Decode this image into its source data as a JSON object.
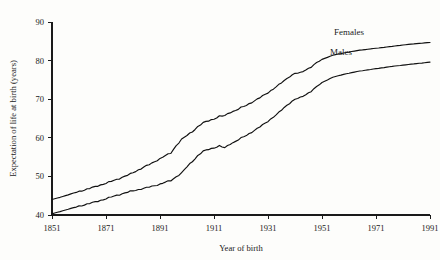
{
  "chart_data": {
    "type": "line",
    "title": "",
    "xlabel": "Year of birth",
    "ylabel": "Expectation of life at birth (years)",
    "xlim": [
      1851,
      1991
    ],
    "ylim": [
      40,
      90
    ],
    "xticks": [
      "1851",
      "1871",
      "1891",
      "1911",
      "1931",
      "1951",
      "1971",
      "1991"
    ],
    "yticks": [
      "40",
      "50",
      "60",
      "70",
      "80",
      "90"
    ],
    "grid": false,
    "legend_position": "inline-right",
    "x": [
      1851,
      1855,
      1860,
      1865,
      1870,
      1875,
      1880,
      1885,
      1888,
      1891,
      1893,
      1895,
      1897,
      1899,
      1901,
      1903,
      1905,
      1907,
      1909,
      1911,
      1913,
      1915,
      1917,
      1919,
      1921,
      1923,
      1925,
      1927,
      1929,
      1931,
      1933,
      1935,
      1937,
      1939,
      1941,
      1943,
      1945,
      1947,
      1949,
      1951,
      1955,
      1960,
      1965,
      1971,
      1977,
      1983,
      1991
    ],
    "series": [
      {
        "name": "Females",
        "label": "Females",
        "color": "#111111",
        "values": [
          44.0,
          44.8,
          45.9,
          46.9,
          48.0,
          49.2,
          50.6,
          52.4,
          53.4,
          54.6,
          55.4,
          56.0,
          58.0,
          59.6,
          60.6,
          61.6,
          62.9,
          63.9,
          64.4,
          64.9,
          65.6,
          65.7,
          66.6,
          67.1,
          67.8,
          68.4,
          69.2,
          70.0,
          70.8,
          71.7,
          72.7,
          73.7,
          74.8,
          75.9,
          76.7,
          76.8,
          77.6,
          78.4,
          79.4,
          80.3,
          81.4,
          82.1,
          82.7,
          83.2,
          83.7,
          84.2,
          84.7
        ]
      },
      {
        "name": "Males",
        "label": "Males",
        "color": "#111111",
        "values": [
          40.3,
          41.1,
          42.1,
          43.0,
          44.0,
          45.1,
          46.1,
          46.9,
          47.4,
          48.0,
          48.5,
          48.9,
          49.9,
          50.9,
          52.5,
          53.9,
          55.4,
          56.5,
          57.0,
          57.4,
          57.9,
          57.4,
          58.4,
          59.1,
          59.9,
          60.6,
          61.5,
          62.4,
          63.3,
          64.3,
          65.4,
          66.5,
          67.8,
          69.0,
          70.0,
          70.4,
          71.2,
          72.1,
          73.2,
          74.3,
          75.7,
          76.6,
          77.3,
          77.9,
          78.5,
          79.0,
          79.6
        ]
      }
    ],
    "annotations": [
      {
        "text": "Females",
        "series": "Females",
        "x": 1961,
        "y": 86.6
      },
      {
        "text": "Males",
        "series": "Males",
        "x": 1958,
        "y": 81.5
      }
    ]
  }
}
